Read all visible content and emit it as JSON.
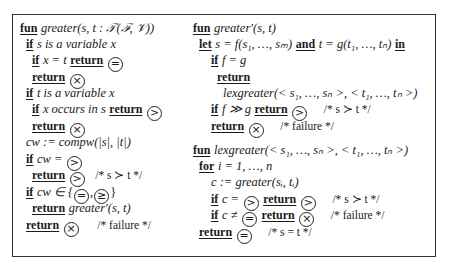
{
  "left_column": {
    "lines": [
      {
        "kw": "fun",
        "text": "greater(s, t : 𝒯(ℱ, 𝒱))"
      },
      {
        "kw": "if",
        "text": "s is a variable x"
      },
      {
        "kw": "if",
        "text": "x = t",
        "kw2": "return",
        "symbol": "="
      },
      {
        "kw": "return",
        "symbol": "×"
      },
      {
        "kw": "if",
        "text": "t is a variable x"
      },
      {
        "kw": "if",
        "text": "x occurs in s",
        "kw2": "return",
        "symbol": ">"
      },
      {
        "kw": "return",
        "symbol": "×"
      },
      {
        "text": "cw := compw(|s|, |t|)"
      },
      {
        "kw": "if",
        "text": "cw =",
        "symbol": ">"
      },
      {
        "kw": "return",
        "symbol": ">",
        "comment": "/* s ≻ t */"
      },
      {
        "kw": "if",
        "text": "cw ∈ {",
        "symbols": [
          "=",
          "≥"
        ],
        "text_end": "}"
      },
      {
        "kw": "return",
        "text": "greater′(s, t)"
      },
      {
        "kw": "return",
        "symbol": "×",
        "comment": "/* failure */"
      }
    ]
  },
  "right_column": {
    "lines": [
      {
        "kw": "fun",
        "text": "greater′(s, t)"
      },
      {
        "kw": "let",
        "text": "s = f(s₁, …, sₘ)",
        "kw2": "and",
        "text2": "t = g(t₁, …, tₙ)",
        "kw3": "in"
      },
      {
        "kw": "if",
        "text": "f = g"
      },
      {
        "kw": "return"
      },
      {
        "text": "lexgreater(< s₁, …, sₙ >, < t₁, …, tₙ >)"
      },
      {
        "kw": "if",
        "text": "f ≫ g",
        "kw2": "return",
        "symbol": ">",
        "comment": "/* s ≻ t */"
      },
      {
        "kw": "return",
        "symbol": "×",
        "comment": "/* failure */"
      },
      {
        "kw": "fun",
        "text": "lexgreater(< s₁, …, sₙ >, < t₁, …, tₙ >)"
      },
      {
        "kw": "for",
        "text": "i = 1, …, n"
      },
      {
        "text": "c := greater(sᵢ, tᵢ)"
      },
      {
        "kw": "if",
        "text": "c =",
        "symbol": ">",
        "kw2": "return",
        "symbol2": ">",
        "comment": "/* s ≻ t */"
      },
      {
        "kw": "if",
        "text": "c ≠",
        "symbol": "=",
        "kw2": "return",
        "symbol2": "×",
        "comment": "/* failure */"
      },
      {
        "kw": "return",
        "symbol": "=",
        "comment": "/* s = t */"
      }
    ]
  }
}
